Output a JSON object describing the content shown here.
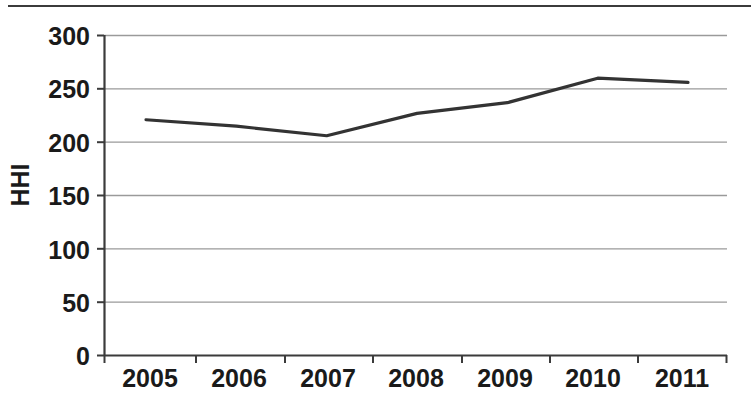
{
  "chart_data": {
    "type": "line",
    "title": "",
    "xlabel": "",
    "ylabel": "HHI",
    "x": [
      2005,
      2006,
      2007,
      2008,
      2009,
      2010,
      2011
    ],
    "categories": [
      "2005",
      "2006",
      "2007",
      "2008",
      "2009",
      "2010",
      "2011"
    ],
    "values": [
      221,
      215,
      206,
      227,
      237,
      260,
      256
    ],
    "series": [
      {
        "name": "HHI",
        "values": [
          221,
          215,
          206,
          227,
          237,
          260,
          256
        ],
        "color": "#333333"
      }
    ],
    "ylim": [
      0,
      300
    ],
    "ytick_values": [
      0,
      50,
      100,
      150,
      200,
      250,
      300
    ],
    "ytick_labels": [
      "0",
      "50",
      "100",
      "150",
      "200",
      "250",
      "300"
    ],
    "xtick_labels": [
      "2005",
      "2006",
      "2007",
      "2008",
      "2009",
      "2010",
      "2011"
    ],
    "grid": "horizontal",
    "legend": "none",
    "gridline_color": "#999999",
    "axis_color": "#3b3b3b",
    "line_color": "#333333",
    "background": "#ffffff",
    "annotations": []
  },
  "axis": {
    "y_label_text": "HHI"
  }
}
